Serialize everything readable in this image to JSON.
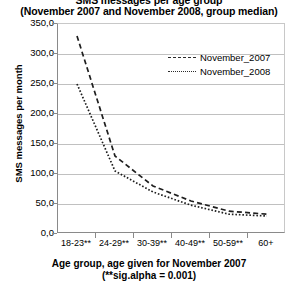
{
  "title": {
    "line1": "SMS messages per age group",
    "line2": "(November 2007 and November 2008, group median)"
  },
  "axis": {
    "x_title_line1": "Age group, age given for November 2007",
    "x_title_line2": "(**sig.alpha = 0.001)",
    "y_title": "SMS messages per month"
  },
  "legend": {
    "items": [
      {
        "label": "November_2007",
        "style": "dashed"
      },
      {
        "label": "November_2008",
        "style": "dotted"
      }
    ]
  },
  "chart_data": {
    "type": "line",
    "title": "SMS messages per age group (November 2007 and November 2008, group median)",
    "xlabel": "Age group, age given for November 2007 (**sig.alpha = 0.001)",
    "ylabel": "SMS messages per month",
    "categories": [
      "18-23**",
      "24-29**",
      "30-39**",
      "40-49**",
      "50-59**",
      "60+"
    ],
    "series": [
      {
        "name": "November_2007",
        "values": [
          330,
          130,
          80,
          55,
          38,
          33
        ]
      },
      {
        "name": "November_2008",
        "values": [
          250,
          105,
          70,
          48,
          33,
          30
        ]
      }
    ],
    "ylim": [
      0,
      350
    ],
    "ytick_labels": [
      "0,0",
      "50,0",
      "100,0",
      "150,0",
      "200,0",
      "250,0",
      "300,0",
      "350,0"
    ],
    "ytick_values": [
      0,
      50,
      100,
      150,
      200,
      250,
      300,
      350
    ],
    "grid": true,
    "legend_position": "top-right"
  },
  "colors": {
    "series_line": "#1e1e1e",
    "gridline": "#c0c0c0",
    "axis": "#8a8a8a",
    "background": "#ffffff"
  }
}
